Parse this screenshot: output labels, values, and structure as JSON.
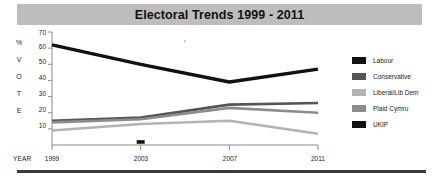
{
  "title": {
    "text": "Electoral Trends 1999 - 2011"
  },
  "axes": {
    "y_caption_chars": [
      "%",
      "V",
      "O",
      "T",
      "E"
    ],
    "y_caption_full": "% VOTE",
    "y_ticks": [
      70,
      60,
      50,
      40,
      30,
      20,
      10
    ],
    "x_caption": "YEAR",
    "x_ticks": [
      "1999",
      "2003",
      "2007",
      "2011"
    ]
  },
  "legend": {
    "items": [
      {
        "label": "Labour",
        "color": "#111111"
      },
      {
        "label": "Conservative",
        "color": "#555555"
      },
      {
        "label": "Liberal/Lib Dem",
        "color": "#b3b3b3"
      },
      {
        "label": "Plaid Cymru",
        "color": "#8c8c8c"
      },
      {
        "label": "UKIP",
        "color": "#111111"
      }
    ]
  },
  "chart_data": {
    "type": "line",
    "title": "Electoral Trends 1999 - 2011",
    "xlabel": "YEAR",
    "ylabel": "% VOTE",
    "x": [
      1999,
      2003,
      2007,
      2011
    ],
    "categories": [
      "1999",
      "2003",
      "2007",
      "2011"
    ],
    "ylim": [
      0,
      70
    ],
    "xlim": [
      1999,
      2011
    ],
    "grid": false,
    "legend_position": "right",
    "series": [
      {
        "name": "Labour",
        "color": "#111111",
        "values": [
          62,
          50,
          39,
          47
        ]
      },
      {
        "name": "Conservative",
        "color": "#555555",
        "values": [
          15,
          17,
          25,
          26
        ]
      },
      {
        "name": "Liberal/Lib Dem",
        "color": "#b3b3b3",
        "values": [
          9,
          13,
          15,
          7
        ]
      },
      {
        "name": "Plaid Cymru",
        "color": "#8c8c8c",
        "values": [
          14,
          16,
          23,
          20
        ]
      },
      {
        "name": "UKIP",
        "color": "#111111",
        "values": [
          null,
          2,
          null,
          null
        ]
      }
    ],
    "annotations": [
      {
        "text": "UKIP marker",
        "x": 2003,
        "y": 2
      }
    ]
  }
}
